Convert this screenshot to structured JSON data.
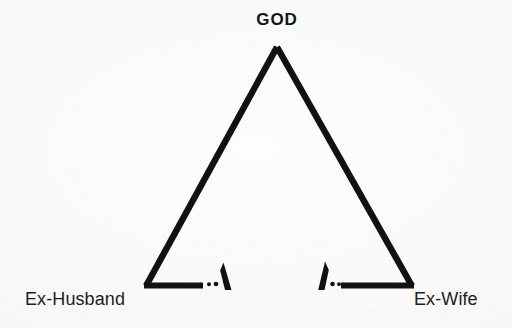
{
  "diagram": {
    "type": "broken-triangle",
    "title_label": "GOD",
    "left_label": "Ex-Husband",
    "right_label": "Ex-Wife",
    "ink_color": "#111111",
    "background_color": "#f7f7f6",
    "stroke_width_px": 6,
    "vertices": {
      "apex": {
        "x": 277,
        "y": 47
      },
      "left": {
        "x": 146,
        "y": 286
      },
      "right": {
        "x": 412,
        "y": 286
      }
    },
    "edges": [
      {
        "name": "apex-to-left",
        "from": "apex",
        "to": "left",
        "state": "intact"
      },
      {
        "name": "apex-to-right",
        "from": "apex",
        "to": "right",
        "state": "intact"
      },
      {
        "name": "left-to-right-base",
        "from": "left",
        "to": "right",
        "state": "broken"
      }
    ],
    "base_break": {
      "left_segment_end_x": 203,
      "right_segment_start_x": 341,
      "gap_dots": [
        {
          "x": 209,
          "y": 284,
          "r": 2.0
        },
        {
          "x": 216,
          "y": 284,
          "r": 2.2
        },
        {
          "x": 332,
          "y": 284,
          "r": 2.2
        },
        {
          "x": 339,
          "y": 284,
          "r": 2.0
        }
      ],
      "left_spike": {
        "base_x": 228,
        "base_y": 290,
        "tip_x": 223,
        "tip_y": 263
      },
      "right_spike": {
        "base_x": 320,
        "base_y": 290,
        "tip_x": 325,
        "tip_y": 262
      }
    }
  }
}
